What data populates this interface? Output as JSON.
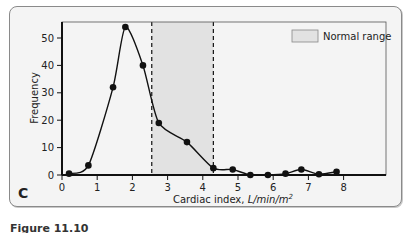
{
  "panel_label": "C",
  "caption": "Figure 11.10",
  "chart_data": {
    "type": "line",
    "title": "",
    "xlabel": "Cardiac index, L/min/m²",
    "xlabel_plain": "Cardiac index, ",
    "xlabel_unit": "L/min/m",
    "xlabel_sup": "2",
    "ylabel": "Frequency",
    "xlim": [
      0,
      9.3
    ],
    "ylim": [
      0,
      56
    ],
    "xticks": [
      0,
      1,
      2,
      3,
      4,
      5,
      6,
      7,
      8
    ],
    "yticks": [
      0,
      10,
      20,
      30,
      40,
      50
    ],
    "grid": false,
    "legend": {
      "position": "top-right",
      "entries": [
        {
          "label": "Normal range",
          "type": "shaded-box",
          "color": "#e2e2e2"
        }
      ]
    },
    "shaded_region": {
      "label": "Normal range",
      "x_start": 2.55,
      "x_end": 4.3,
      "color": "#e2e2e2",
      "borders": "dashed"
    },
    "series": [
      {
        "name": "Frequency",
        "marker": "filled-circle",
        "color": "#111111",
        "x": [
          0.2,
          0.75,
          1.45,
          1.8,
          2.3,
          2.75,
          3.55,
          4.3,
          4.85,
          5.35,
          5.85,
          6.35,
          6.8,
          7.3,
          7.8
        ],
        "y": [
          0.5,
          3.5,
          32,
          54,
          40,
          19,
          12,
          2.5,
          2,
          0,
          0,
          0.5,
          2,
          0.3,
          1.2
        ]
      }
    ]
  }
}
